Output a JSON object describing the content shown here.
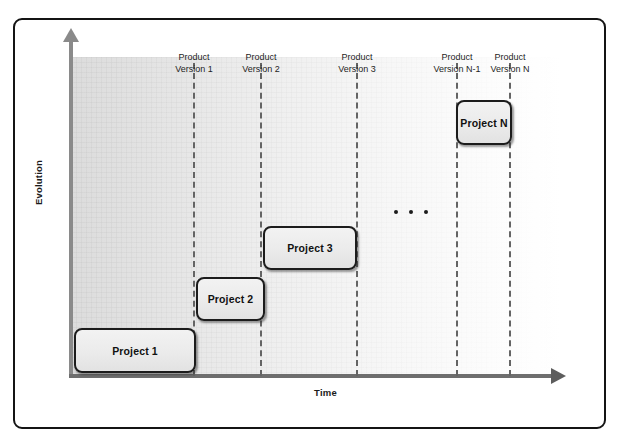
{
  "figure": {
    "axes": {
      "y_title": "Evolution",
      "x_title": "Time",
      "y_arrow_icon": "arrow-up-icon",
      "x_arrow_icon": "arrow-right-icon"
    },
    "continuation_icon": "ellipsis-icon"
  },
  "chart_data": {
    "type": "diagram",
    "title": "",
    "xlabel": "Time",
    "ylabel": "Evolution",
    "grid": true,
    "legend": null,
    "version_markers": [
      {
        "label_line1": "Product",
        "label_line2": "Version 1",
        "x": 193
      },
      {
        "label_line1": "Product",
        "label_line2": "Version 2",
        "x": 260
      },
      {
        "label_line1": "Product",
        "label_line2": "Version 3",
        "x": 356
      },
      {
        "label_line1": "Product",
        "label_line2": "Version N-1",
        "x": 456
      },
      {
        "label_line1": "Product",
        "label_line2": "Version N",
        "x": 509
      }
    ],
    "projects": [
      {
        "label": "Project 1",
        "x": 74,
        "y": 328,
        "width": 122,
        "height": 45
      },
      {
        "label": "Project 2",
        "x": 196,
        "y": 277,
        "width": 69,
        "height": 44
      },
      {
        "label": "Project 3",
        "x": 263,
        "y": 226,
        "width": 94,
        "height": 44
      },
      {
        "label": "Project N",
        "x": 456,
        "y": 100,
        "width": 56,
        "height": 45
      }
    ],
    "ellipsis_dots": 3,
    "colors": {
      "frame_border": "#141414",
      "box_border": "#1c1c1c",
      "box_fill": "#ebebeb",
      "marker_line": "#646464",
      "y_axis": "#8a8a8a",
      "x_axis": "#6e6e6e",
      "plot_background_left": "#dcdcdc",
      "plot_background_right": "#ffffff",
      "text": "#1b1b1b"
    }
  }
}
